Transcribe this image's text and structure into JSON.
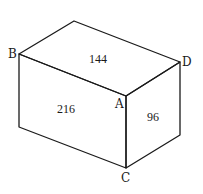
{
  "figure": {
    "type": "rectangular prism (cuboid) in oblique view",
    "vertex_labels": {
      "B": "B",
      "D": "D",
      "A": "A",
      "C": "C"
    },
    "face_areas": {
      "top": "144",
      "front": "216",
      "side": "96"
    }
  }
}
